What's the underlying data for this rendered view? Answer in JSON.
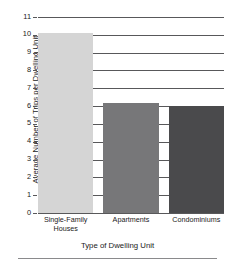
{
  "chart_data": {
    "type": "bar",
    "title": "",
    "xlabel": "Type of Dwelling Unit",
    "ylabel": "Average Number of Trips per Dwelling Unit",
    "categories": [
      "Single-Family Houses",
      "Apartments",
      "Condominiums"
    ],
    "values": [
      10.1,
      6.15,
      6.0
    ],
    "bar_colors": [
      "#d5d5d5",
      "#777779",
      "#4a4a4c"
    ],
    "ylim": [
      0,
      11
    ],
    "yticks": [
      0,
      1,
      2,
      3,
      4,
      5,
      6,
      7,
      8,
      9,
      10,
      11
    ],
    "ytick_labels": [
      "0",
      "1",
      "2",
      "3",
      "4",
      "5",
      "6",
      "7",
      "8",
      "9",
      "10",
      "11"
    ],
    "grid": true,
    "grid_color": "#58585a",
    "legend": null,
    "legend_position": "none"
  },
  "axis": {
    "x_tick_labels": [
      {
        "line1": "Single-Family",
        "line2": "Houses"
      },
      {
        "line1": "Apartments",
        "line2": ""
      },
      {
        "line1": "Condominiums",
        "line2": ""
      }
    ]
  }
}
